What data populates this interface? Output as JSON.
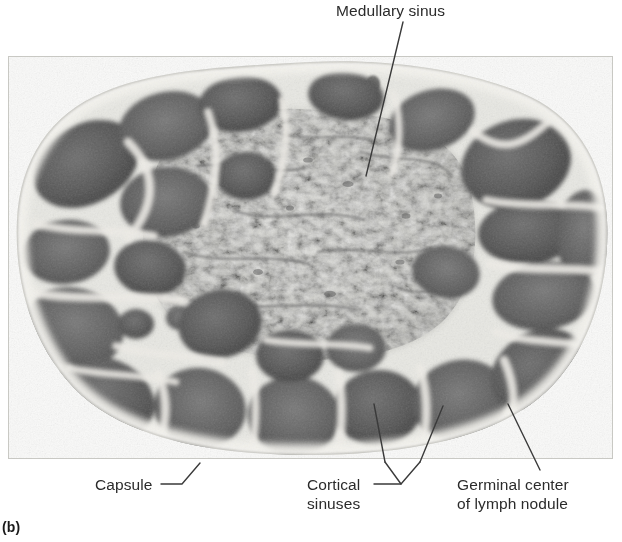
{
  "figure": {
    "panel_letter": "(b)",
    "image_kind": "light-micrograph-lymph-node-cross-section",
    "image_tone": "grayscale"
  },
  "labels": {
    "medullary_sinus": "Medullary sinus",
    "capsule": "Capsule",
    "cortical_sinuses_line1": "Cortical",
    "cortical_sinuses_line2": "sinuses",
    "germinal_center_line1": "Germinal center",
    "germinal_center_line2": "of lymph nodule"
  },
  "colors": {
    "text": "#2b2b2b",
    "leader_line": "#3a3a3a",
    "background": "#ffffff",
    "tissue_dark": "#4a4a4a",
    "tissue_mid": "#8d8d8d",
    "tissue_light": "#d9d9d6",
    "capsule_pale": "#f1f1ee"
  }
}
